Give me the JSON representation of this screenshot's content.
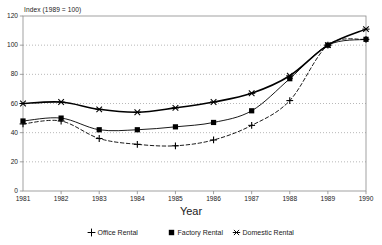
{
  "chart_data": {
    "type": "line",
    "title": "",
    "ylabel": "Index (1989 = 100)",
    "xlabel": "Year",
    "categories": [
      "1981",
      "1982",
      "1983",
      "1984",
      "1985",
      "1986",
      "1987",
      "1988",
      "1989",
      "1990"
    ],
    "ylim": [
      0,
      120
    ],
    "yticks": [
      0,
      20,
      40,
      60,
      80,
      100,
      120
    ],
    "ytick_labels": [
      "0",
      "20",
      "40",
      "60",
      "80",
      "100",
      "120"
    ],
    "grid": true,
    "grid_style": "dotted-horizontal",
    "legend_position": "bottom",
    "plot_frame": true,
    "colors": {
      "line": "#000000",
      "frame": "#8a8a8a",
      "grid": "#9a9a9a",
      "text": "#1a1a1a"
    },
    "series": [
      {
        "name": "Office Rental",
        "marker": "plus-icon",
        "line_style": "dashed",
        "line_width": 0.9,
        "color": "#000000",
        "values": [
          46,
          48,
          36,
          32,
          31,
          35,
          45,
          62,
          100,
          104
        ]
      },
      {
        "name": "Factory Rental",
        "marker": "square-icon",
        "line_style": "solid",
        "line_width": 0.9,
        "color": "#000000",
        "values": [
          48,
          50,
          42,
          42,
          44,
          47,
          55,
          77,
          100,
          104
        ]
      },
      {
        "name": "Domestic Rental",
        "marker": "asterisk-icon",
        "line_style": "solid",
        "line_width": 1.6,
        "color": "#000000",
        "values": [
          60,
          61,
          56,
          54,
          57,
          61,
          67,
          79,
          100,
          111
        ]
      }
    ]
  }
}
